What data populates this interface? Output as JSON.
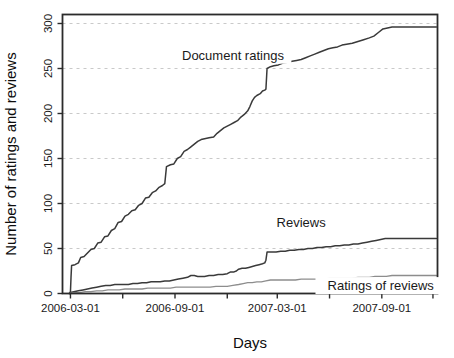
{
  "chart_data": {
    "type": "line",
    "title": "",
    "xlabel": "Days",
    "ylabel": "Number of ratings and reviews",
    "grid": true,
    "legend_position": "inline-annotations",
    "xlim": [
      0,
      660
    ],
    "ylim": [
      0,
      310
    ],
    "y_ticks": [
      0,
      50,
      100,
      150,
      200,
      250,
      300
    ],
    "y_tick_labels": [
      "0",
      "50",
      "100",
      "150",
      "200",
      "250",
      "300"
    ],
    "x_tick_labels": [
      "2006-03-01",
      "2006-09-01",
      "2007-03-01",
      "2007-09-01"
    ],
    "x_tick_positions": [
      14,
      198,
      378,
      562
    ],
    "x_minor_tick_positions": [
      106,
      290,
      470,
      652
    ],
    "annotations": [
      {
        "text": "Document ratings",
        "x": 300,
        "y": 262
      },
      {
        "text": "Reviews",
        "x": 420,
        "y": 76
      },
      {
        "text": "Ratings of reviews",
        "x": 560,
        "y": 6
      }
    ],
    "series": [
      {
        "name": "Document ratings",
        "color": "#3a3a3a",
        "points": [
          [
            12,
            0
          ],
          [
            14,
            2
          ],
          [
            15,
            18
          ],
          [
            16,
            31
          ],
          [
            22,
            32
          ],
          [
            28,
            34
          ],
          [
            32,
            40
          ],
          [
            38,
            41
          ],
          [
            44,
            45
          ],
          [
            50,
            49
          ],
          [
            56,
            50
          ],
          [
            62,
            56
          ],
          [
            68,
            57
          ],
          [
            74,
            63
          ],
          [
            80,
            64
          ],
          [
            86,
            70
          ],
          [
            92,
            72
          ],
          [
            98,
            79
          ],
          [
            104,
            80
          ],
          [
            110,
            86
          ],
          [
            116,
            88
          ],
          [
            122,
            92
          ],
          [
            128,
            93
          ],
          [
            134,
            98
          ],
          [
            140,
            100
          ],
          [
            146,
            106
          ],
          [
            152,
            107
          ],
          [
            158,
            112
          ],
          [
            164,
            114
          ],
          [
            170,
            118
          ],
          [
            176,
            120
          ],
          [
            180,
            122
          ],
          [
            183,
            141
          ],
          [
            190,
            143
          ],
          [
            196,
            144
          ],
          [
            202,
            150
          ],
          [
            208,
            152
          ],
          [
            214,
            158
          ],
          [
            220,
            160
          ],
          [
            226,
            163
          ],
          [
            232,
            166
          ],
          [
            238,
            169
          ],
          [
            244,
            171
          ],
          [
            250,
            172
          ],
          [
            258,
            173
          ],
          [
            266,
            174
          ],
          [
            272,
            178
          ],
          [
            278,
            181
          ],
          [
            284,
            184
          ],
          [
            290,
            186
          ],
          [
            296,
            188
          ],
          [
            302,
            190
          ],
          [
            308,
            192
          ],
          [
            314,
            196
          ],
          [
            320,
            199
          ],
          [
            326,
            203
          ],
          [
            330,
            208
          ],
          [
            334,
            214
          ],
          [
            338,
            218
          ],
          [
            342,
            220
          ],
          [
            348,
            222
          ],
          [
            352,
            225
          ],
          [
            356,
            226
          ],
          [
            358,
            227
          ],
          [
            360,
            250
          ],
          [
            366,
            252
          ],
          [
            372,
            253
          ],
          [
            380,
            254
          ],
          [
            388,
            256
          ],
          [
            396,
            257
          ],
          [
            404,
            258
          ],
          [
            412,
            259
          ],
          [
            420,
            260
          ],
          [
            428,
            262
          ],
          [
            436,
            264
          ],
          [
            444,
            266
          ],
          [
            452,
            268
          ],
          [
            460,
            270
          ],
          [
            468,
            272
          ],
          [
            476,
            273
          ],
          [
            484,
            274
          ],
          [
            492,
            276
          ],
          [
            500,
            277
          ],
          [
            510,
            278
          ],
          [
            520,
            280
          ],
          [
            530,
            282
          ],
          [
            540,
            284
          ],
          [
            548,
            286
          ],
          [
            556,
            290
          ],
          [
            564,
            294
          ],
          [
            572,
            295
          ],
          [
            580,
            296
          ],
          [
            588,
            296
          ],
          [
            596,
            296
          ],
          [
            604,
            296
          ],
          [
            612,
            296
          ],
          [
            620,
            296
          ],
          [
            628,
            296
          ],
          [
            636,
            296
          ],
          [
            644,
            296
          ],
          [
            652,
            296
          ],
          [
            658,
            296
          ]
        ]
      },
      {
        "name": "Reviews",
        "color": "#3a3a3a",
        "points": [
          [
            12,
            0
          ],
          [
            14,
            1
          ],
          [
            20,
            2
          ],
          [
            28,
            3
          ],
          [
            36,
            4
          ],
          [
            44,
            5
          ],
          [
            52,
            6
          ],
          [
            60,
            7
          ],
          [
            68,
            8
          ],
          [
            76,
            9
          ],
          [
            84,
            9
          ],
          [
            92,
            10
          ],
          [
            100,
            10
          ],
          [
            108,
            10
          ],
          [
            116,
            10
          ],
          [
            124,
            11
          ],
          [
            132,
            11
          ],
          [
            140,
            12
          ],
          [
            148,
            12
          ],
          [
            156,
            13
          ],
          [
            164,
            13
          ],
          [
            172,
            13
          ],
          [
            180,
            14
          ],
          [
            188,
            14
          ],
          [
            196,
            15
          ],
          [
            204,
            16
          ],
          [
            212,
            17
          ],
          [
            220,
            18
          ],
          [
            226,
            20
          ],
          [
            232,
            20
          ],
          [
            238,
            19
          ],
          [
            244,
            19
          ],
          [
            250,
            19
          ],
          [
            258,
            20
          ],
          [
            266,
            20
          ],
          [
            274,
            21
          ],
          [
            282,
            21
          ],
          [
            290,
            22
          ],
          [
            296,
            24
          ],
          [
            302,
            24
          ],
          [
            306,
            25
          ],
          [
            310,
            27
          ],
          [
            316,
            28
          ],
          [
            322,
            28
          ],
          [
            328,
            29
          ],
          [
            334,
            30
          ],
          [
            340,
            31
          ],
          [
            346,
            32
          ],
          [
            352,
            33
          ],
          [
            356,
            34
          ],
          [
            358,
            37
          ],
          [
            360,
            46
          ],
          [
            368,
            46
          ],
          [
            376,
            46
          ],
          [
            384,
            47
          ],
          [
            392,
            47
          ],
          [
            400,
            48
          ],
          [
            408,
            48
          ],
          [
            416,
            49
          ],
          [
            424,
            49
          ],
          [
            432,
            50
          ],
          [
            440,
            50
          ],
          [
            448,
            51
          ],
          [
            456,
            51
          ],
          [
            464,
            52
          ],
          [
            472,
            52
          ],
          [
            480,
            53
          ],
          [
            488,
            53
          ],
          [
            496,
            54
          ],
          [
            504,
            54
          ],
          [
            512,
            55
          ],
          [
            520,
            55
          ],
          [
            528,
            56
          ],
          [
            536,
            57
          ],
          [
            544,
            58
          ],
          [
            552,
            59
          ],
          [
            560,
            60
          ],
          [
            568,
            61
          ],
          [
            576,
            61
          ],
          [
            584,
            61
          ],
          [
            592,
            61
          ],
          [
            600,
            61
          ],
          [
            610,
            61
          ],
          [
            620,
            61
          ],
          [
            630,
            61
          ],
          [
            640,
            61
          ],
          [
            650,
            61
          ],
          [
            658,
            61
          ]
        ]
      },
      {
        "name": "Ratings of reviews",
        "color": "#8d8d8d",
        "points": [
          [
            12,
            0
          ],
          [
            20,
            1
          ],
          [
            30,
            1
          ],
          [
            40,
            2
          ],
          [
            50,
            2
          ],
          [
            60,
            3
          ],
          [
            70,
            3
          ],
          [
            80,
            4
          ],
          [
            90,
            4
          ],
          [
            100,
            4
          ],
          [
            110,
            5
          ],
          [
            120,
            5
          ],
          [
            130,
            5
          ],
          [
            140,
            5
          ],
          [
            150,
            6
          ],
          [
            160,
            6
          ],
          [
            170,
            6
          ],
          [
            180,
            6
          ],
          [
            190,
            6
          ],
          [
            200,
            7
          ],
          [
            210,
            7
          ],
          [
            220,
            7
          ],
          [
            230,
            7
          ],
          [
            240,
            7
          ],
          [
            250,
            7
          ],
          [
            260,
            7
          ],
          [
            270,
            8
          ],
          [
            280,
            8
          ],
          [
            290,
            8
          ],
          [
            300,
            9
          ],
          [
            310,
            10
          ],
          [
            318,
            11
          ],
          [
            326,
            12
          ],
          [
            334,
            12
          ],
          [
            342,
            13
          ],
          [
            350,
            13
          ],
          [
            358,
            14
          ],
          [
            366,
            15
          ],
          [
            374,
            15
          ],
          [
            382,
            15
          ],
          [
            390,
            15
          ],
          [
            400,
            15
          ],
          [
            410,
            15
          ],
          [
            420,
            16
          ],
          [
            430,
            16
          ],
          [
            440,
            16
          ],
          [
            450,
            16
          ],
          [
            460,
            16
          ],
          [
            470,
            17
          ],
          [
            480,
            17
          ],
          [
            490,
            17
          ],
          [
            500,
            17
          ],
          [
            510,
            17
          ],
          [
            520,
            18
          ],
          [
            530,
            18
          ],
          [
            540,
            18
          ],
          [
            550,
            19
          ],
          [
            560,
            19
          ],
          [
            570,
            19
          ],
          [
            580,
            20
          ],
          [
            590,
            20
          ],
          [
            600,
            20
          ],
          [
            612,
            20
          ],
          [
            624,
            20
          ],
          [
            636,
            20
          ],
          [
            648,
            20
          ],
          [
            658,
            20
          ]
        ]
      }
    ]
  }
}
